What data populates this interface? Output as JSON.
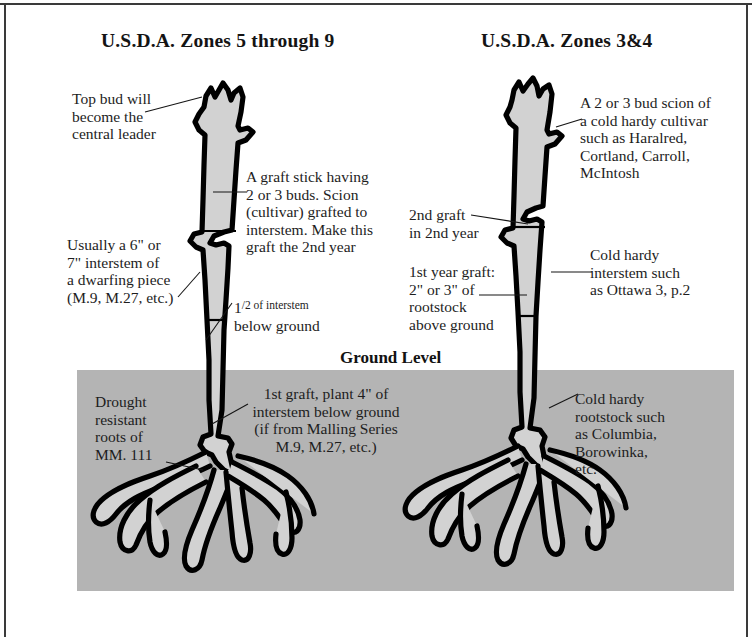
{
  "diagram": {
    "title_left": "U.S.D.A. Zones 5 through 9",
    "title_right": "U.S.D.A. Zones 3&4",
    "ground_label": "Ground Level",
    "colors": {
      "soil": "#b4b4b4",
      "stem_fill": "#d2d2d2",
      "outline": "#000000",
      "background": "#ffffff",
      "text": "#1a1a1a"
    }
  },
  "left_tree": {
    "annotations": {
      "top_bud": "Top bud will\nbecome the\ncentral leader",
      "graft_stick": "A graft stick having\n2 or 3 buds. Scion\n(cultivar) grafted to\ninterstem. Make this\ngraft the 2nd year",
      "interstem": "Usually a 6\" or\n7\" interstem of\na dwarfing piece\n(M.9, M.27, etc.)",
      "half_interstem_line1_prefix": "1",
      "half_interstem_line1_suffix": "/2 of interstem",
      "half_interstem_line2": "below ground",
      "first_graft": "1st graft, plant 4\" of\ninterstem below ground\n(if from Malling Series\nM.9, M.27, etc.)",
      "roots": "Drought\nresistant\nroots of\nMM. 111"
    }
  },
  "right_tree": {
    "annotations": {
      "scion": "A 2 or 3 bud scion of\na cold hardy cultivar\nsuch as Haralred,\nCortland, Carroll,\nMcIntosh",
      "second_graft": "2nd graft\nin 2nd year",
      "first_year_graft": "1st year graft:\n2\" or 3\" of\nrootstock\nabove ground",
      "interstem": "Cold hardy\ninterstem such\nas Ottawa 3, p.2",
      "rootstock": "Cold hardy\nrootstock such\nas Columbia,\nBorowinka,\netc."
    }
  }
}
